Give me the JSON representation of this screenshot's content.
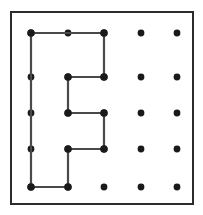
{
  "figure": {
    "name": "geoboard-polygon",
    "width": 203,
    "height": 215,
    "background_color": "#ffffff"
  },
  "border": {
    "name": "board-frame",
    "x": 11,
    "y": 12,
    "width": 182,
    "height": 192,
    "stroke_color": "#2b2b2b",
    "stroke_width": 2,
    "fill": "#ffffff"
  },
  "grid": {
    "rows": 5,
    "cols": 5,
    "peg_color": "#1a1a1a",
    "peg_radius": 3.4,
    "x_positions": [
      31,
      68,
      104,
      141,
      177
    ],
    "y_positions": [
      33,
      77,
      113,
      149,
      187
    ],
    "pegs": [
      {
        "col": 0,
        "row": 0,
        "x": 31,
        "y": 33
      },
      {
        "col": 1,
        "row": 0,
        "x": 68,
        "y": 33
      },
      {
        "col": 2,
        "row": 0,
        "x": 104,
        "y": 33
      },
      {
        "col": 3,
        "row": 0,
        "x": 141,
        "y": 33
      },
      {
        "col": 4,
        "row": 0,
        "x": 177,
        "y": 33
      },
      {
        "col": 0,
        "row": 1,
        "x": 31,
        "y": 77
      },
      {
        "col": 1,
        "row": 1,
        "x": 68,
        "y": 77
      },
      {
        "col": 2,
        "row": 1,
        "x": 104,
        "y": 77
      },
      {
        "col": 3,
        "row": 1,
        "x": 141,
        "y": 77
      },
      {
        "col": 4,
        "row": 1,
        "x": 177,
        "y": 77
      },
      {
        "col": 0,
        "row": 2,
        "x": 31,
        "y": 113
      },
      {
        "col": 1,
        "row": 2,
        "x": 68,
        "y": 113
      },
      {
        "col": 2,
        "row": 2,
        "x": 104,
        "y": 113
      },
      {
        "col": 3,
        "row": 2,
        "x": 141,
        "y": 113
      },
      {
        "col": 4,
        "row": 2,
        "x": 177,
        "y": 113
      },
      {
        "col": 0,
        "row": 3,
        "x": 31,
        "y": 149
      },
      {
        "col": 1,
        "row": 3,
        "x": 68,
        "y": 149
      },
      {
        "col": 2,
        "row": 3,
        "x": 104,
        "y": 149
      },
      {
        "col": 3,
        "row": 3,
        "x": 141,
        "y": 149
      },
      {
        "col": 4,
        "row": 3,
        "x": 177,
        "y": 149
      },
      {
        "col": 0,
        "row": 4,
        "x": 31,
        "y": 187
      },
      {
        "col": 1,
        "row": 4,
        "x": 68,
        "y": 187
      },
      {
        "col": 2,
        "row": 4,
        "x": 104,
        "y": 187
      },
      {
        "col": 3,
        "row": 4,
        "x": 141,
        "y": 187
      },
      {
        "col": 4,
        "row": 4,
        "x": 177,
        "y": 187
      }
    ]
  },
  "polygon": {
    "name": "rubber-band-polygon",
    "closed": true,
    "stroke_color": "#4a4a4a",
    "stroke_width": 2.2,
    "fill": "none",
    "vertex_grid_points": [
      [
        0,
        0
      ],
      [
        2,
        0
      ],
      [
        2,
        1
      ],
      [
        1,
        1
      ],
      [
        1,
        2
      ],
      [
        2,
        2
      ],
      [
        2,
        3
      ],
      [
        1,
        3
      ],
      [
        1,
        4
      ],
      [
        0,
        4
      ]
    ],
    "points_px": "31,33 104,33 104,77 68,77 68,113 104,113 104,149 68,149 68,187 31,187",
    "vertex_markers": [
      {
        "x": 31,
        "y": 33
      },
      {
        "x": 104,
        "y": 33
      },
      {
        "x": 104,
        "y": 77
      },
      {
        "x": 68,
        "y": 77
      },
      {
        "x": 68,
        "y": 113
      },
      {
        "x": 104,
        "y": 113
      },
      {
        "x": 104,
        "y": 149
      },
      {
        "x": 68,
        "y": 149
      },
      {
        "x": 68,
        "y": 187
      },
      {
        "x": 31,
        "y": 187
      }
    ]
  }
}
